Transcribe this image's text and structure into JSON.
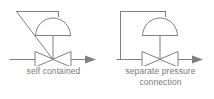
{
  "diagram": {
    "type": "p-and-id-valve-symbols",
    "background_color": "#ffffff",
    "line_color": "#808080",
    "text_color": "#7a7a7a",
    "symbols": [
      {
        "id": "self-contained",
        "caption": "self contained",
        "icon_name": "self-contained-regulator-icon",
        "elements": [
          "process-pipe-line",
          "flow-direction-arrow",
          "globe-valve-body",
          "valve-stem",
          "diaphragm-actuator-dome",
          "internal-sensing-line-diagonal"
        ]
      },
      {
        "id": "separate-pressure-connection",
        "caption": "separate pressure\nconnection",
        "caption_line_1": "separate pressure",
        "caption_line_2": "connection",
        "icon_name": "separate-pressure-connection-regulator-icon",
        "elements": [
          "process-pipe-line",
          "flow-direction-arrow",
          "globe-valve-body",
          "valve-stem",
          "diaphragm-actuator-dome",
          "external-sensing-line-rectangular"
        ]
      }
    ]
  }
}
